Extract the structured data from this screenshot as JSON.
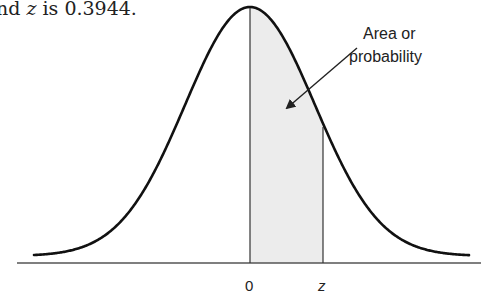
{
  "caption": {
    "prefix": "nd ",
    "var": "z",
    "suffix": " is 0.3944."
  },
  "annotation": {
    "line1": "Area or",
    "line2": "probability"
  },
  "axis": {
    "tick_zero": "0",
    "tick_z": "z"
  },
  "colors": {
    "curve": "#111111",
    "shade": "#ececec",
    "axis": "#555555"
  },
  "diagram": {
    "type": "normal-distribution-shaded-area",
    "shaded_region": {
      "from": "0",
      "to": "z"
    },
    "area_value": 0.3944
  }
}
